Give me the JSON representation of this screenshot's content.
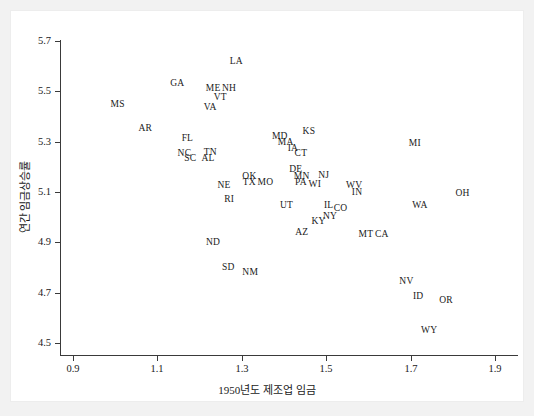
{
  "chart_data": {
    "type": "scatter",
    "title": "",
    "xlabel": "1950년도 제조업 임금",
    "ylabel": "연간 임금상승률",
    "xlim": [
      0.9,
      1.9
    ],
    "ylim": [
      4.5,
      5.7
    ],
    "xticks": [
      "0.9",
      "1.1",
      "1.3",
      "1.5",
      "1.7",
      "1.9"
    ],
    "yticks": [
      "5.7",
      "5.5",
      "5.3",
      "5.1",
      "4.9",
      "4.7",
      "4.5"
    ],
    "xtick_values": [
      0.9,
      1.1,
      1.3,
      1.5,
      1.7,
      1.9
    ],
    "ytick_values": [
      5.7,
      5.5,
      5.3,
      5.1,
      4.9,
      4.7,
      4.5
    ],
    "grid": false,
    "legend": "none",
    "marker_style": "text-label",
    "point_color": "#1a1a1a",
    "points": [
      {
        "label": "MS",
        "x": 1.006,
        "y": 5.444
      },
      {
        "label": "AR",
        "x": 1.071,
        "y": 5.352
      },
      {
        "label": "GA",
        "x": 1.147,
        "y": 5.529
      },
      {
        "label": "FL",
        "x": 1.171,
        "y": 5.312
      },
      {
        "label": "NC",
        "x": 1.164,
        "y": 5.253
      },
      {
        "label": "SC",
        "x": 1.178,
        "y": 5.233
      },
      {
        "label": "TN",
        "x": 1.225,
        "y": 5.257
      },
      {
        "label": "AL",
        "x": 1.22,
        "y": 5.233
      },
      {
        "label": "VA",
        "x": 1.225,
        "y": 5.432
      },
      {
        "label": "ME",
        "x": 1.232,
        "y": 5.509
      },
      {
        "label": "VT",
        "x": 1.249,
        "y": 5.473
      },
      {
        "label": "NH",
        "x": 1.27,
        "y": 5.509
      },
      {
        "label": "LA",
        "x": 1.287,
        "y": 5.616
      },
      {
        "label": "NE",
        "x": 1.258,
        "y": 5.126
      },
      {
        "label": "RI",
        "x": 1.27,
        "y": 5.07
      },
      {
        "label": "ND",
        "x": 1.232,
        "y": 4.896
      },
      {
        "label": "SD",
        "x": 1.268,
        "y": 4.8
      },
      {
        "label": "NM",
        "x": 1.32,
        "y": 4.78
      },
      {
        "label": "OK",
        "x": 1.318,
        "y": 5.161
      },
      {
        "label": "TX",
        "x": 1.318,
        "y": 5.134
      },
      {
        "label": "MO",
        "x": 1.356,
        "y": 5.134
      },
      {
        "label": "MD",
        "x": 1.39,
        "y": 5.32
      },
      {
        "label": "MA",
        "x": 1.404,
        "y": 5.296
      },
      {
        "label": "IA",
        "x": 1.421,
        "y": 5.273
      },
      {
        "label": "CT",
        "x": 1.44,
        "y": 5.253
      },
      {
        "label": "DE",
        "x": 1.428,
        "y": 5.189
      },
      {
        "label": "MN",
        "x": 1.442,
        "y": 5.161
      },
      {
        "label": "PA",
        "x": 1.44,
        "y": 5.134
      },
      {
        "label": "WI",
        "x": 1.473,
        "y": 5.13
      },
      {
        "label": "KS",
        "x": 1.459,
        "y": 5.34
      },
      {
        "label": "NJ",
        "x": 1.494,
        "y": 5.165
      },
      {
        "label": "UT",
        "x": 1.406,
        "y": 5.046
      },
      {
        "label": "IL",
        "x": 1.506,
        "y": 5.046
      },
      {
        "label": "CO",
        "x": 1.534,
        "y": 5.034
      },
      {
        "label": "NY",
        "x": 1.509,
        "y": 5.002
      },
      {
        "label": "KY",
        "x": 1.482,
        "y": 4.982
      },
      {
        "label": "AZ",
        "x": 1.442,
        "y": 4.938
      },
      {
        "label": "WV",
        "x": 1.566,
        "y": 5.126
      },
      {
        "label": "IN",
        "x": 1.573,
        "y": 5.098
      },
      {
        "label": "MT",
        "x": 1.594,
        "y": 4.93
      },
      {
        "label": "CA",
        "x": 1.632,
        "y": 4.93
      },
      {
        "label": "WA",
        "x": 1.722,
        "y": 5.046
      },
      {
        "label": "MI",
        "x": 1.71,
        "y": 5.292
      },
      {
        "label": "OH",
        "x": 1.823,
        "y": 5.094
      },
      {
        "label": "NV",
        "x": 1.69,
        "y": 4.744
      },
      {
        "label": "ID",
        "x": 1.718,
        "y": 4.684
      },
      {
        "label": "OR",
        "x": 1.784,
        "y": 4.668
      },
      {
        "label": "WY",
        "x": 1.744,
        "y": 4.548
      }
    ]
  }
}
